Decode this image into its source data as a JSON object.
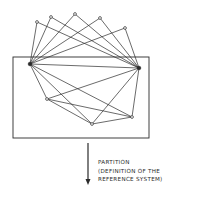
{
  "diagram": {
    "stroke_color": "#2b2b2b",
    "background": "#ffffff",
    "nodes": {
      "top": [
        {
          "id": "T1",
          "x": 37,
          "y": 22
        },
        {
          "id": "T2",
          "x": 51,
          "y": 17
        },
        {
          "id": "T3",
          "x": 75,
          "y": 14
        },
        {
          "id": "T4",
          "x": 100,
          "y": 18
        },
        {
          "id": "T5",
          "x": 125,
          "y": 28
        }
      ],
      "hubs": [
        {
          "id": "L",
          "x": 30,
          "y": 64
        },
        {
          "id": "R",
          "x": 139,
          "y": 68
        }
      ],
      "bottom": [
        {
          "id": "B1",
          "x": 47,
          "y": 99
        },
        {
          "id": "B2",
          "x": 92,
          "y": 124
        },
        {
          "id": "B3",
          "x": 132,
          "y": 117
        }
      ]
    },
    "edges": [
      [
        "T1",
        "L"
      ],
      [
        "T1",
        "R"
      ],
      [
        "T2",
        "L"
      ],
      [
        "T2",
        "R"
      ],
      [
        "T3",
        "L"
      ],
      [
        "T3",
        "R"
      ],
      [
        "T4",
        "L"
      ],
      [
        "T4",
        "R"
      ],
      [
        "T5",
        "L"
      ],
      [
        "T5",
        "R"
      ],
      [
        "L",
        "R"
      ],
      [
        "L",
        "B1"
      ],
      [
        "L",
        "B2"
      ],
      [
        "L",
        "B3"
      ],
      [
        "R",
        "B1"
      ],
      [
        "R",
        "B2"
      ],
      [
        "R",
        "B3"
      ],
      [
        "B1",
        "B2"
      ],
      [
        "B1",
        "B3"
      ],
      [
        "B2",
        "B3"
      ]
    ],
    "partition_box": {
      "x": 13,
      "y": 57,
      "width": 136,
      "height": 81
    },
    "arrow": {
      "x": 88,
      "y1": 143,
      "y2": 185
    }
  },
  "caption": {
    "line1": "PARTITION",
    "line2": "(DEFINITION OF THE",
    "line3": "REFERENCE SYSTEM)"
  }
}
